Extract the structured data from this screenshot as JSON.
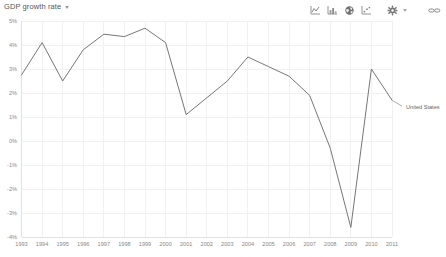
{
  "header": {
    "title": "GDP growth rate",
    "title_caret_icon": "chevron-down-icon"
  },
  "toolbar": {
    "buttons": [
      {
        "name": "line-chart-icon",
        "label": "Line chart"
      },
      {
        "name": "bar-chart-icon",
        "label": "Bar chart"
      },
      {
        "name": "globe-map-icon",
        "label": "Map"
      },
      {
        "name": "scatter-chart-icon",
        "label": "Scatter chart"
      },
      {
        "name": "gear-icon",
        "label": "Settings"
      },
      {
        "name": "link-icon",
        "label": "Link"
      }
    ]
  },
  "legend": {
    "entries": [
      {
        "label": "United States",
        "color": "#777777"
      }
    ]
  },
  "chart_data": {
    "type": "line",
    "title": "GDP growth rate",
    "xlabel": "",
    "ylabel": "",
    "grid": true,
    "legend_position": "right",
    "xlim": [
      1993,
      2011
    ],
    "ylim": [
      -4,
      5
    ],
    "ytick_labels": [
      "5%",
      "4%",
      "3%",
      "2%",
      "1%",
      "0%",
      "-1%",
      "-2%",
      "-3%",
      "-4%"
    ],
    "yticks": [
      5,
      4,
      3,
      2,
      1,
      0,
      -1,
      -2,
      -3,
      -4
    ],
    "xtick_labels": [
      "1993",
      "1994",
      "1995",
      "1996",
      "1997",
      "1998",
      "1999",
      "2000",
      "2001",
      "2002",
      "2003",
      "2004",
      "2005",
      "2006",
      "2007",
      "2008",
      "2009",
      "2010",
      "2011"
    ],
    "x": [
      1993,
      1994,
      1995,
      1996,
      1997,
      1998,
      1999,
      2000,
      2001,
      2002,
      2003,
      2004,
      2005,
      2006,
      2007,
      2008,
      2009,
      2010,
      2011
    ],
    "series": [
      {
        "name": "United States",
        "color": "#777777",
        "values": [
          2.75,
          4.1,
          2.5,
          3.8,
          4.45,
          4.35,
          4.7,
          4.1,
          1.1,
          1.8,
          2.5,
          3.5,
          3.1,
          2.7,
          1.9,
          -0.3,
          -3.6,
          3.0,
          1.7
        ]
      }
    ]
  }
}
